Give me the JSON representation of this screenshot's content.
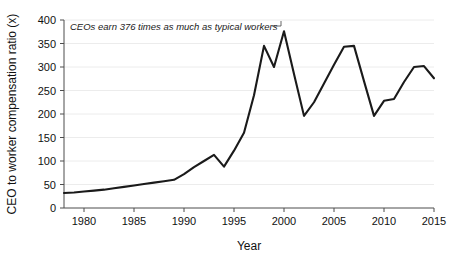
{
  "chart_data": {
    "type": "line",
    "title": "",
    "subtitle": "",
    "xlabel": "Year",
    "ylabel": "CEO to worker compensation ratio (x)",
    "xlim": [
      1978,
      2015
    ],
    "ylim": [
      0,
      400
    ],
    "grid": true,
    "legend": "none",
    "x_ticks": [
      1980,
      1985,
      1990,
      1995,
      2000,
      2005,
      2010,
      2015
    ],
    "x_tick_labels": [
      "1980",
      "1985",
      "1990",
      "1995",
      "2000",
      "2005",
      "2010",
      "2015"
    ],
    "y_ticks": [
      0,
      50,
      100,
      150,
      200,
      250,
      300,
      350,
      400
    ],
    "y_tick_labels": [
      "0",
      "50",
      "100",
      "150",
      "200",
      "250",
      "300",
      "350",
      "400"
    ],
    "annotations": [
      {
        "text": "CEOs earn 376 times as much as typical workers",
        "points_to_x": 2000,
        "points_to_y": 376
      }
    ],
    "x": [
      1978,
      1979,
      1980,
      1981,
      1982,
      1983,
      1984,
      1985,
      1986,
      1987,
      1988,
      1989,
      1990,
      1991,
      1992,
      1993,
      1994,
      1995,
      1996,
      1997,
      1998,
      1999,
      2000,
      2001,
      2002,
      2003,
      2004,
      2005,
      2006,
      2007,
      2008,
      2009,
      2010,
      2011,
      2012,
      2013,
      2014,
      2015
    ],
    "values": [
      32,
      33,
      35,
      37,
      39,
      42,
      45,
      48,
      51,
      54,
      57,
      60,
      72,
      87,
      100,
      113,
      88,
      122,
      160,
      240,
      345,
      300,
      376,
      285,
      196,
      225,
      265,
      305,
      343,
      345,
      270,
      196,
      228,
      232,
      268,
      300,
      302,
      276
    ],
    "series": [
      {
        "name": "CEO to worker compensation ratio",
        "color": "#1a1a1a",
        "values": [
          32,
          33,
          35,
          37,
          39,
          42,
          45,
          48,
          51,
          54,
          57,
          60,
          72,
          87,
          100,
          113,
          88,
          122,
          160,
          240,
          345,
          300,
          376,
          285,
          196,
          225,
          265,
          305,
          343,
          345,
          270,
          196,
          228,
          232,
          268,
          300,
          302,
          276
        ]
      }
    ]
  },
  "colors": {
    "background": "#ffffff",
    "line": "#1a1a1a",
    "axis": "#4d4d4d",
    "grid": "#ececec",
    "text": "#111111"
  }
}
